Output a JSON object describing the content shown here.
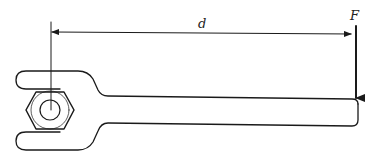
{
  "figure": {
    "labels": {
      "distance": "d",
      "force": "F"
    },
    "colors": {
      "line": "#1a1a1a",
      "background": "#ffffff",
      "text": "#222222"
    },
    "elements": [
      {
        "name": "wrench",
        "type": "outline"
      },
      {
        "name": "hex-nut",
        "type": "hexagon"
      },
      {
        "name": "bolt",
        "type": "circle"
      },
      {
        "name": "reference-line",
        "type": "line"
      },
      {
        "name": "distance-dimension",
        "type": "double-arrow",
        "label": "d"
      },
      {
        "name": "force-arrow",
        "type": "arrow",
        "label": "F",
        "direction": "down"
      }
    ]
  }
}
